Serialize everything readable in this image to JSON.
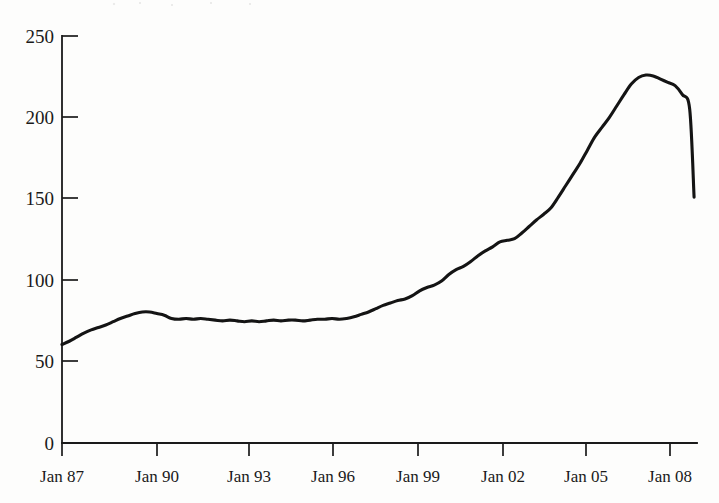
{
  "chart_data": {
    "type": "line",
    "title": "",
    "subtitle": "",
    "xlabel": "",
    "ylabel": "",
    "grid": false,
    "legend": "none",
    "line_color": "#141414",
    "background_color": "#fdfdfc",
    "xlim": [
      1987.0,
      2008.75
    ],
    "ylim": [
      0,
      250
    ],
    "yticks": [
      0,
      50,
      100,
      150,
      200,
      250
    ],
    "ytick_labels": [
      "0",
      "50",
      "100",
      "150",
      "200",
      "250"
    ],
    "xticks": [
      1987.0,
      1990.0,
      1993.0,
      1996.0,
      1999.0,
      2002.0,
      2005.0,
      2008.0
    ],
    "xtick_labels": [
      "Jan 87",
      "Jan 90",
      "Jan 93",
      "Jan 96",
      "Jan 99",
      "Jan 02",
      "Jan 05",
      "Jan 08"
    ],
    "series": [
      {
        "name": "Index",
        "x": [
          1987.0,
          1987.25,
          1987.5,
          1987.75,
          1988.0,
          1988.25,
          1988.5,
          1988.75,
          1989.0,
          1989.25,
          1989.5,
          1989.75,
          1990.0,
          1990.25,
          1990.5,
          1990.75,
          1991.0,
          1991.25,
          1991.5,
          1991.75,
          1992.0,
          1992.25,
          1992.5,
          1992.75,
          1993.0,
          1993.25,
          1993.5,
          1993.75,
          1994.0,
          1994.25,
          1994.5,
          1994.75,
          1995.0,
          1995.25,
          1995.5,
          1995.75,
          1996.0,
          1996.25,
          1996.5,
          1996.75,
          1997.0,
          1997.25,
          1997.5,
          1997.75,
          1998.0,
          1998.25,
          1998.5,
          1998.75,
          1999.0,
          1999.25,
          1999.5,
          1999.75,
          2000.0,
          2000.25,
          2000.5,
          2000.75,
          2001.0,
          2001.25,
          2001.5,
          2001.75,
          2002.0,
          2002.25,
          2002.5,
          2002.75,
          2003.0,
          2003.25,
          2003.5,
          2003.75,
          2004.0,
          2004.25,
          2004.5,
          2004.75,
          2005.0,
          2005.25,
          2005.5,
          2005.75,
          2006.0,
          2006.25,
          2006.5,
          2006.75,
          2007.0,
          2007.25,
          2007.5,
          2007.75,
          2008.0,
          2008.25,
          2008.5,
          2008.65
        ],
        "values": [
          60.5,
          62.5,
          65.0,
          67.5,
          69.5,
          71.0,
          72.5,
          74.5,
          76.5,
          78.0,
          79.5,
          80.5,
          80.5,
          79.5,
          78.5,
          76.5,
          76.0,
          76.5,
          76.0,
          76.5,
          76.0,
          75.5,
          75.0,
          75.5,
          75.0,
          74.5,
          75.0,
          74.5,
          75.0,
          75.5,
          75.0,
          75.5,
          75.5,
          75.0,
          75.5,
          76.0,
          76.0,
          76.5,
          76.0,
          76.5,
          77.5,
          79.0,
          80.5,
          82.5,
          84.5,
          86.0,
          87.5,
          88.5,
          90.5,
          93.5,
          95.5,
          97.0,
          99.5,
          103.5,
          106.5,
          108.5,
          111.5,
          115.0,
          118.0,
          120.5,
          123.5,
          124.5,
          125.5,
          129.0,
          133.0,
          137.0,
          140.5,
          144.5,
          151.0,
          158.0,
          165.0,
          172.0,
          180.0,
          188.0,
          194.0,
          200.0,
          207.0,
          214.0,
          220.5,
          224.5,
          226.0,
          225.5,
          223.5,
          221.5,
          219.5,
          214.0,
          205.0,
          151.0
        ]
      }
    ],
    "peak": {
      "value": 226,
      "approx_date": "2006"
    },
    "start_value": 60.5,
    "end_value": 151
  }
}
